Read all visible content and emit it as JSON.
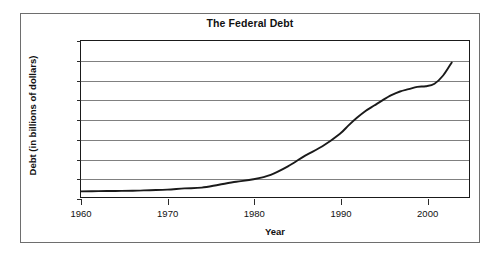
{
  "chart_data": {
    "type": "line",
    "title": "The Federal Debt",
    "xlabel": "Year",
    "ylabel": "Debt (in billions of dollars)",
    "xlim": [
      1960,
      2005
    ],
    "ylim": [
      0,
      8000
    ],
    "grid": true,
    "legend": false,
    "x_ticks": [
      "1960",
      "1970",
      "1980",
      "1990",
      "2000"
    ],
    "x_tick_values": [
      1960,
      1970,
      1980,
      1990,
      2000
    ],
    "y_ticks": [
      "0",
      "1000",
      "2000",
      "3000",
      "4000",
      "5000",
      "6000",
      "7000",
      "8000"
    ],
    "y_tick_values": [
      0,
      1000,
      2000,
      3000,
      4000,
      5000,
      6000,
      7000,
      8000
    ],
    "series": [
      {
        "name": "Federal Debt",
        "color": "#1a1a1a",
        "x": [
          1960,
          1962,
          1964,
          1966,
          1968,
          1970,
          1972,
          1974,
          1976,
          1978,
          1980,
          1982,
          1984,
          1986,
          1988,
          1990,
          1991,
          1992,
          1993,
          1994,
          1995,
          1996,
          1997,
          1998,
          1999,
          2000,
          2001,
          2002,
          2003
        ],
        "values": [
          290,
          300,
          310,
          320,
          350,
          380,
          440,
          480,
          630,
          780,
          910,
          1140,
          1570,
          2120,
          2600,
          3230,
          3660,
          4060,
          4410,
          4690,
          4970,
          5220,
          5410,
          5530,
          5650,
          5680,
          5810,
          6230,
          6900
        ]
      }
    ]
  },
  "axes": {
    "title": "The Federal Debt",
    "y_label": "Debt (in billions of dollars)",
    "x_label": "Year"
  }
}
